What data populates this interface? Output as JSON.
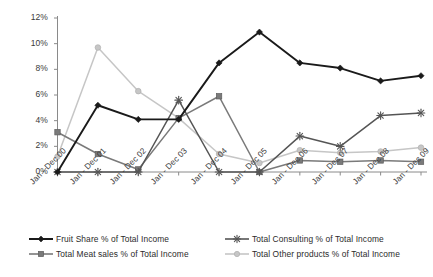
{
  "chart_data": {
    "type": "line",
    "title": "",
    "xlabel": "",
    "ylabel": "",
    "ylim": [
      0,
      12
    ],
    "ytick_values": [
      0,
      2,
      4,
      6,
      8,
      10,
      12
    ],
    "ytick_labels": [
      "0%",
      "2%",
      "4%",
      "6%",
      "8%",
      "10%",
      "12%"
    ],
    "grid": false,
    "legend_position": "bottom",
    "categories": [
      "Jan - Dec 00",
      "Jan - Dec 01",
      "Jan - Dec 02",
      "Jan - Dec 03",
      "Jan - Dec 04",
      "Jan - Dec 05",
      "Jan - Dec 06",
      "Jan - Dec 07",
      "Jan - Dec 08",
      "Jan - Dec 09"
    ],
    "series": [
      {
        "name": "Fruit Share % of Total Income",
        "color": "#1a1a1a",
        "marker": "diamond",
        "values": [
          0.0,
          5.2,
          4.1,
          4.1,
          8.5,
          10.9,
          8.5,
          8.1,
          7.1,
          7.5
        ]
      },
      {
        "name": "Total Meat sales  % of Total Income",
        "color": "#7a7a7a",
        "marker": "square",
        "values": [
          3.1,
          1.4,
          0.2,
          4.2,
          5.9,
          0.0,
          0.9,
          0.8,
          0.9,
          0.8
        ]
      },
      {
        "name": "Total Consulting % of Total Income",
        "color": "#555555",
        "marker": "star",
        "values": [
          0.0,
          0.0,
          0.0,
          5.6,
          0.0,
          0.0,
          2.8,
          2.0,
          4.4,
          4.6
        ]
      },
      {
        "name": "Total Other products  % of Total Income",
        "color": "#c6c6c6",
        "marker": "circle",
        "values": [
          1.2,
          9.7,
          6.3,
          4.2,
          1.4,
          0.7,
          1.7,
          1.5,
          1.6,
          1.9
        ]
      }
    ]
  },
  "legend": {
    "items": [
      {
        "label": "Fruit Share % of Total Income"
      },
      {
        "label": "Total Consulting % of Total Income"
      },
      {
        "label": "Total Meat sales  % of Total Income"
      },
      {
        "label": "Total Other products  % of Total Income"
      }
    ]
  },
  "axis": {
    "axis_color": "#8a8a8a"
  }
}
